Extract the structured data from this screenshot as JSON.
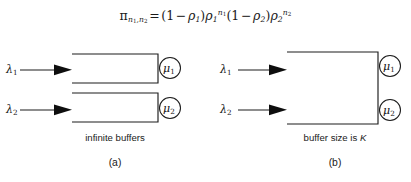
{
  "figure": {
    "formula": {
      "lhs_symbol": "π",
      "lhs_subscript": "n₁,n₂",
      "equals": "=",
      "rhs": "(1 − ρ₁)ρ₁^{n₁}(1 − ρ₂)ρ₂^{n₂}",
      "plain_text": "π_{n1,n2} = (1 - ρ1)ρ1^{n1}(1 - ρ2)ρ2^{n2}",
      "tokens": {
        "pi": "π",
        "one": "1",
        "minus": "−",
        "rho": "ρ",
        "n": "n",
        "idx1": "1",
        "idx2": "2",
        "lparen": "(",
        "rparen": ")",
        "eq": "="
      }
    },
    "panel_a": {
      "caption": "(a)",
      "buffer_label": "infinite buffers",
      "arrows": [
        {
          "label": "λ",
          "index": "1"
        },
        {
          "label": "λ",
          "index": "2"
        }
      ],
      "servers": [
        {
          "label": "μ",
          "index": "1"
        },
        {
          "label": "μ",
          "index": "2"
        }
      ],
      "queue_count": 2
    },
    "panel_b": {
      "caption": "(b)",
      "buffer_label": "buffer size is ",
      "buffer_label_italic": "K",
      "arrows": [
        {
          "label": "λ",
          "index": "1"
        },
        {
          "label": "λ",
          "index": "2"
        }
      ],
      "servers": [
        {
          "label": "μ",
          "index": "1"
        },
        {
          "label": "μ",
          "index": "2"
        }
      ],
      "queue_count": 1
    },
    "colors": {
      "background": "#ffffff",
      "ink": "#1c1c1c",
      "text": "#1a1a1a"
    }
  }
}
